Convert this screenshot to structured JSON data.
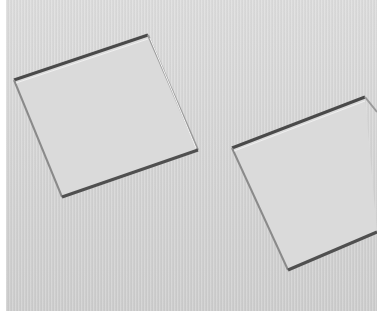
{
  "image": {
    "description": "Embossed textured paper with two raised tilted squares",
    "background_color": "#d6d6d6",
    "shadow_color": "#555555",
    "highlight_color": "#f2f2f2",
    "shapes": [
      {
        "name": "left-square",
        "points": [
          [
            14,
            80
          ],
          [
            148,
            35
          ],
          [
            198,
            150
          ],
          [
            62,
            197
          ]
        ]
      },
      {
        "name": "right-square",
        "points": [
          [
            232,
            148
          ],
          [
            365,
            97
          ],
          [
            377,
            232
          ],
          [
            288,
            270
          ]
        ]
      }
    ]
  }
}
